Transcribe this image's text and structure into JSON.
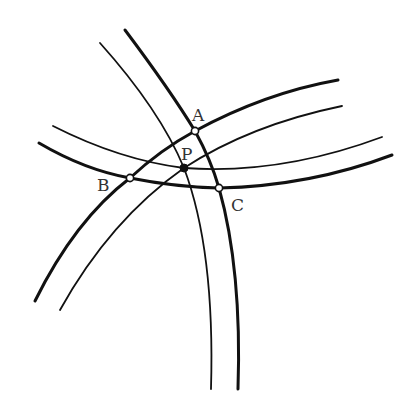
{
  "diagram": {
    "type": "geometry-arcs",
    "colors": {
      "stroke": "#111111",
      "label": "#333333",
      "background": "#ffffff"
    },
    "points": [
      {
        "id": "A",
        "label": "A",
        "x": 195,
        "y": 131,
        "style": "open",
        "label_x": 192,
        "label_y": 121
      },
      {
        "id": "B",
        "label": "B",
        "x": 130,
        "y": 178,
        "style": "open",
        "label_x": 97,
        "label_y": 191
      },
      {
        "id": "C",
        "label": "C",
        "x": 219,
        "y": 188,
        "style": "open",
        "label_x": 231,
        "label_y": 211
      },
      {
        "id": "P",
        "label": "P",
        "x": 184,
        "y": 168,
        "style": "filled",
        "label_x": 181,
        "label_y": 160
      }
    ],
    "arcs": [
      {
        "name": "arc-AC-thick",
        "weight": "thick",
        "path": "M125,30 Q170,90 195,131 Q211,160 219,188 Q242,270 238,389"
      },
      {
        "name": "arc-P-vertical-thin",
        "weight": "thin",
        "path": "M100,43 Q160,110 184,168 Q215,250 211,389"
      },
      {
        "name": "arc-BA-thick",
        "weight": "thick",
        "path": "M35,301 Q75,220 130,178 Q160,150 195,131 Q265,93 338,80"
      },
      {
        "name": "arc-P-rising-thin",
        "weight": "thin",
        "path": "M60,310 Q110,220 184,168 Q250,125 342,106"
      },
      {
        "name": "arc-P-horizontal-thin",
        "weight": "thin",
        "path": "M53,126 Q120,160 184,168 Q280,175 382,137"
      },
      {
        "name": "arc-BC-thick",
        "weight": "thick",
        "path": "M39,143 Q85,170 130,178 Q175,187 219,188 Q310,186 392,155"
      }
    ]
  }
}
